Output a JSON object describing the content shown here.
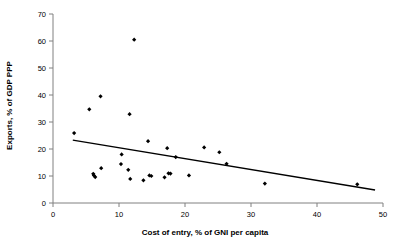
{
  "chart_data": {
    "type": "scatter",
    "title": "",
    "xlabel": "Cost of entry, % of GNI per capita",
    "ylabel": "Exports, % of GDP PPP",
    "xlim": [
      0,
      50
    ],
    "ylim": [
      0,
      70
    ],
    "xticks": [
      "0",
      "10",
      "20",
      "30",
      "40",
      "50"
    ],
    "xtick_values": [
      0,
      10,
      20,
      30,
      40,
      50
    ],
    "yticks": [
      "0",
      "10",
      "20",
      "30",
      "40",
      "50",
      "60",
      "70"
    ],
    "ytick_values": [
      0,
      10,
      20,
      30,
      40,
      50,
      60,
      70
    ],
    "grid": false,
    "legend": null,
    "marker_color": "#000000",
    "marker_shape": "diamond",
    "axis_color": "#808080",
    "trendline_color": "#000000",
    "series": [
      {
        "name": "Countries",
        "points": [
          {
            "x": 3.2,
            "y": 25.9
          },
          {
            "x": 5.5,
            "y": 34.7
          },
          {
            "x": 6.1,
            "y": 10.8
          },
          {
            "x": 6.2,
            "y": 10.2
          },
          {
            "x": 6.4,
            "y": 9.6
          },
          {
            "x": 7.2,
            "y": 39.5
          },
          {
            "x": 7.3,
            "y": 12.9
          },
          {
            "x": 10.3,
            "y": 14.4
          },
          {
            "x": 10.4,
            "y": 18.0
          },
          {
            "x": 11.4,
            "y": 12.3
          },
          {
            "x": 11.6,
            "y": 32.9
          },
          {
            "x": 11.7,
            "y": 8.9
          },
          {
            "x": 12.3,
            "y": 60.5
          },
          {
            "x": 13.7,
            "y": 8.4
          },
          {
            "x": 14.4,
            "y": 22.9
          },
          {
            "x": 14.6,
            "y": 10.2
          },
          {
            "x": 14.9,
            "y": 10.0
          },
          {
            "x": 16.9,
            "y": 9.5
          },
          {
            "x": 17.3,
            "y": 20.3
          },
          {
            "x": 17.5,
            "y": 11.0
          },
          {
            "x": 17.8,
            "y": 10.9
          },
          {
            "x": 18.6,
            "y": 17.0
          },
          {
            "x": 20.6,
            "y": 10.2
          },
          {
            "x": 22.9,
            "y": 20.6
          },
          {
            "x": 25.2,
            "y": 18.8
          },
          {
            "x": 26.3,
            "y": 14.5
          },
          {
            "x": 32.1,
            "y": 7.2
          },
          {
            "x": 46.1,
            "y": 6.9
          }
        ]
      }
    ],
    "trendline": {
      "type": "linear",
      "x_start": 3.0,
      "y_start": 23.3,
      "x_end": 48.8,
      "y_end": 4.8
    }
  }
}
